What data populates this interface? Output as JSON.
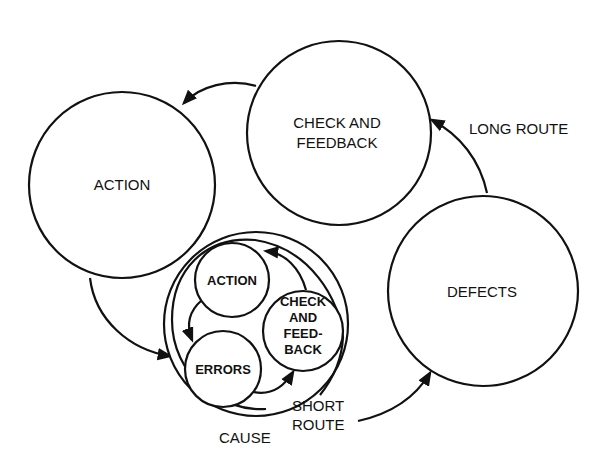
{
  "diagram": {
    "type": "cycle-diagram",
    "colors": {
      "stroke": "#111111",
      "background": "#ffffff"
    },
    "nodes": {
      "action": {
        "label": "ACTION"
      },
      "check_feedback": {
        "label_lines": [
          "CHECK AND",
          "FEEDBACK"
        ]
      },
      "defects": {
        "label": "DEFECTS"
      },
      "inner_action": {
        "label": "ACTION"
      },
      "inner_check": {
        "label_lines": [
          "CHECK",
          "AND",
          "FEED-",
          "BACK"
        ]
      },
      "inner_errors": {
        "label": "ERRORS"
      }
    },
    "annotations": {
      "long_route": "LONG ROUTE",
      "short_route_lines": [
        "SHORT",
        "ROUTE"
      ],
      "cause": "CAUSE"
    },
    "edges": [
      {
        "from": "check_feedback",
        "to": "action"
      },
      {
        "from": "action",
        "to": "cause_cycle"
      },
      {
        "from": "cause_cycle",
        "to": "defects",
        "label": "SHORT ROUTE"
      },
      {
        "from": "defects",
        "to": "check_feedback",
        "label": "LONG ROUTE"
      },
      {
        "from": "inner_action",
        "to": "inner_errors"
      },
      {
        "from": "inner_errors",
        "to": "inner_check"
      },
      {
        "from": "inner_check",
        "to": "inner_action"
      }
    ]
  }
}
